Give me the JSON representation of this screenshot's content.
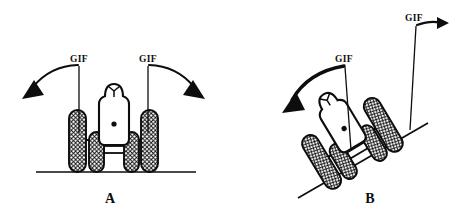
{
  "figure": {
    "type": "line-art-diagram",
    "title": "",
    "background_color": "#ffffff",
    "ink_color": "#0d0d0d",
    "panels": [
      {
        "id": "A",
        "label": "A",
        "description": "Four-wheeled vehicle upright on horizontal ground",
        "ground": "horizontal",
        "gif_labels": [
          "GIF",
          "GIF"
        ],
        "arrows": [
          "curved-arrow-left",
          "curved-arrow-right"
        ]
      },
      {
        "id": "B",
        "label": "B",
        "description": "Same vehicle tilted on an inclined slope",
        "ground": "inclined",
        "gif_labels": [
          "GIF",
          "GIF"
        ],
        "arrows": [
          "curved-arrow-left",
          "straight-arrow-right"
        ]
      }
    ]
  },
  "labels": {
    "gif": "GIF",
    "panel_a": "A",
    "panel_b": "B"
  },
  "colors": {
    "ink": "#0d0d0d",
    "background": "#ffffff",
    "tread_fill": "#ffffff"
  }
}
